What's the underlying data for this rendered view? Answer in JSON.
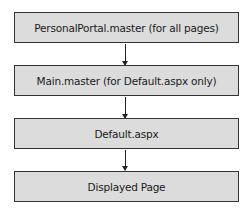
{
  "diagram": {
    "nodes": [
      {
        "label": "PersonalPortal.master (for all pages)"
      },
      {
        "label": "Main.master (for Default.aspx only)"
      },
      {
        "label": "Default.aspx"
      },
      {
        "label": "Displayed Page"
      }
    ],
    "edges": [
      {
        "from": 0,
        "to": 1
      },
      {
        "from": 1,
        "to": 2
      },
      {
        "from": 2,
        "to": 3
      }
    ],
    "colors": {
      "box_fill": "#dcdcdc",
      "box_border": "#333333",
      "arrow": "#222222"
    }
  }
}
